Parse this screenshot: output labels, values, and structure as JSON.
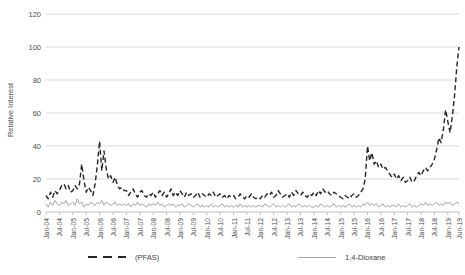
{
  "chart": {
    "y_axis_title": "Relative Interest"
  },
  "chart_data": {
    "type": "line",
    "title": "",
    "xlabel": "",
    "ylabel": "Relative Interest",
    "ylim": [
      0,
      120
    ],
    "yticks": [
      0,
      20,
      40,
      60,
      80,
      100,
      120
    ],
    "grid": "horizontal",
    "grid_color": "#d9d9d9",
    "axis_color": "#bfbfbf",
    "legend_position": "bottom",
    "months": 186,
    "x_range": [
      "Jan-04",
      "Jun-19"
    ],
    "x_tick_indices": [
      0,
      6,
      12,
      18,
      24,
      30,
      36,
      42,
      48,
      54,
      60,
      66,
      72,
      78,
      84,
      90,
      96,
      102,
      108,
      114,
      120,
      126,
      132,
      138,
      144,
      150,
      156,
      162,
      168,
      174,
      180,
      185
    ],
    "x_tick_labels": [
      "Jan-04",
      "Jul-04",
      "Jan-05",
      "Jul-05",
      "Jan-06",
      "Jul-06",
      "Jan-07",
      "Jul-07",
      "Jan-08",
      "Jul-08",
      "Jan-09",
      "Jul-09",
      "Jan-10",
      "Jul-10",
      "Jan-11",
      "Jul-11",
      "Jan-12",
      "Jul-12",
      "Jan-13",
      "Jul-13",
      "Jan-14",
      "Jul-14",
      "Jan-15",
      "Jul-15",
      "Jan-16",
      "Jul-16",
      "Jan-17",
      "Jul-17",
      "Jan-18",
      "Jul-18",
      "Jan-19",
      "Jun-19"
    ],
    "series": [
      {
        "id": "pfas",
        "name": "(PFAS)",
        "color": "#262626",
        "style": "dashed",
        "values": [
          10,
          8,
          12,
          9,
          13,
          11,
          13,
          16,
          17,
          14,
          16,
          12,
          13,
          16,
          14,
          17,
          29,
          19,
          12,
          15,
          13,
          10,
          17,
          28,
          43,
          25,
          37,
          26,
          20,
          22,
          18,
          21,
          16,
          14,
          15,
          13,
          13,
          10,
          12,
          14,
          11,
          9,
          12,
          13,
          10,
          9,
          11,
          10,
          12,
          9,
          11,
          13,
          10,
          12,
          9,
          11,
          14,
          10,
          12,
          10,
          13,
          11,
          9,
          12,
          10,
          11,
          9,
          10,
          12,
          9,
          11,
          10,
          9,
          11,
          10,
          12,
          9,
          10,
          11,
          9,
          10,
          8,
          10,
          9,
          10,
          8,
          9,
          11,
          9,
          8,
          10,
          9,
          11,
          9,
          8,
          9,
          8,
          10,
          9,
          11,
          10,
          12,
          9,
          10,
          13,
          11,
          9,
          10,
          11,
          9,
          12,
          10,
          13,
          11,
          10,
          12,
          10,
          9,
          11,
          10,
          12,
          10,
          13,
          11,
          14,
          12,
          13,
          11,
          10,
          12,
          11,
          10,
          9,
          8,
          10,
          9,
          8,
          10,
          11,
          9,
          10,
          12,
          14,
          20,
          40,
          31,
          36,
          29,
          31,
          27,
          29,
          26,
          27,
          25,
          23,
          21,
          23,
          20,
          22,
          19,
          21,
          18,
          19,
          21,
          18,
          19,
          22,
          24,
          22,
          25,
          27,
          25,
          27,
          29,
          32,
          38,
          45,
          42,
          50,
          62,
          55,
          48,
          58,
          70,
          88,
          100
        ]
      },
      {
        "id": "dioxane",
        "name": "1,4-Dioxane",
        "color": "#a6a6a6",
        "style": "solid",
        "values": [
          5,
          3,
          6,
          4,
          7,
          5,
          4,
          6,
          5,
          7,
          4,
          5,
          6,
          4,
          8,
          5,
          6,
          3,
          5,
          4,
          6,
          5,
          4,
          6,
          5,
          7,
          4,
          6,
          5,
          4,
          5,
          6,
          4,
          5,
          4,
          5,
          4,
          5,
          3,
          5,
          4,
          6,
          4,
          5,
          4,
          3,
          5,
          4,
          5,
          4,
          6,
          4,
          5,
          3,
          4,
          5,
          4,
          5,
          3,
          4,
          4,
          5,
          3,
          4,
          5,
          4,
          3,
          4,
          5,
          3,
          4,
          3,
          4,
          3,
          5,
          3,
          4,
          3,
          4,
          5,
          3,
          4,
          3,
          4,
          3,
          4,
          3,
          5,
          3,
          4,
          3,
          4,
          3,
          4,
          3,
          4,
          4,
          3,
          5,
          4,
          3,
          4,
          5,
          3,
          4,
          3,
          4,
          3,
          4,
          5,
          3,
          4,
          3,
          5,
          4,
          3,
          4,
          3,
          4,
          3,
          3,
          4,
          3,
          5,
          4,
          3,
          4,
          3,
          4,
          5,
          3,
          4,
          3,
          4,
          3,
          4,
          5,
          3,
          4,
          3,
          4,
          3,
          5,
          4,
          6,
          4,
          5,
          4,
          5,
          3,
          4,
          5,
          3,
          4,
          3,
          4,
          4,
          3,
          5,
          3,
          4,
          3,
          4,
          5,
          3,
          4,
          3,
          4,
          5,
          4,
          6,
          4,
          5,
          4,
          5,
          6,
          4,
          5,
          4,
          6,
          5,
          6,
          4,
          5,
          6,
          5
        ]
      }
    ]
  }
}
